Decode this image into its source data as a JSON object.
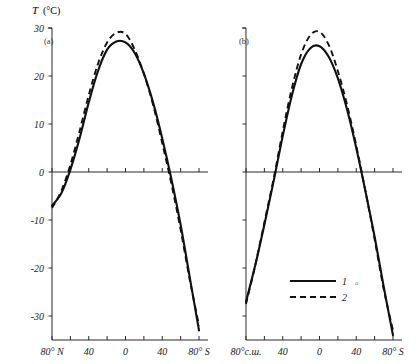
{
  "figure": {
    "y_axis_title_symbol": "T",
    "y_axis_title_unit": "(°C)",
    "panel_a_label": "(a)",
    "panel_b_label": "(b)"
  },
  "legend": {
    "entry1_label": "1",
    "entry2_label": "2",
    "stray_mark": "a"
  },
  "axis": {
    "y_ticks": [
      "30",
      "20",
      "10",
      "0",
      "-10",
      "-20",
      "-30"
    ],
    "panel_a_x_ticks": [
      "80°",
      "N",
      "40",
      "0",
      "40",
      "80",
      "S"
    ],
    "panel_b_x_ticks": [
      "80°с.ш.",
      "40",
      "0",
      "40",
      "80",
      "S"
    ]
  },
  "chart_data": {
    "type": "line",
    "title": "T (°C)",
    "xlabel": "Latitude",
    "ylabel": "T (°C)",
    "ylim": [
      -35,
      30
    ],
    "xlim": [
      80,
      -80
    ],
    "grid": false,
    "legend_position": "bottom-right",
    "panels": [
      {
        "name": "(a)",
        "x_tick_values": [
          80,
          60,
          40,
          20,
          0,
          -20,
          -40,
          -60,
          -80
        ],
        "x_tick_labels": [
          "80° N",
          "",
          "40",
          "",
          "0",
          "",
          "40",
          "",
          "80° S"
        ],
        "series": [
          {
            "name": "1",
            "style": "solid",
            "x": [
              80,
              70,
              60,
              50,
              40,
              30,
              20,
              10,
              0,
              -10,
              -20,
              -30,
              -40,
              -50,
              -60,
              -70,
              -80
            ],
            "values": [
              -7.0,
              -4.5,
              0.5,
              7.0,
              14.5,
              21.0,
              25.5,
              27.2,
              27.0,
              24.8,
              20.5,
              14.5,
              7.0,
              -1.5,
              -11.0,
              -22.0,
              -33.0
            ]
          },
          {
            "name": "2",
            "style": "dashed",
            "x": [
              80,
              70,
              60,
              50,
              40,
              30,
              20,
              10,
              0,
              -10,
              -20,
              -30,
              -40,
              -50,
              -60,
              -70,
              -80
            ],
            "values": [
              -7.5,
              -4.0,
              1.5,
              8.5,
              16.0,
              22.5,
              27.0,
              29.0,
              28.8,
              25.5,
              20.5,
              14.0,
              6.0,
              -2.5,
              -12.0,
              -22.5,
              -32.0
            ]
          }
        ]
      },
      {
        "name": "(b)",
        "x_tick_values": [
          80,
          60,
          40,
          20,
          0,
          -20,
          -40,
          -60,
          -80
        ],
        "x_tick_labels": [
          "80°с.ш.",
          "",
          "40",
          "",
          "0",
          "",
          "40",
          "",
          "80° S"
        ],
        "series": [
          {
            "name": "1",
            "style": "solid",
            "x": [
              80,
              70,
              60,
              50,
              40,
              30,
              20,
              10,
              0,
              -10,
              -20,
              -30,
              -40,
              -50,
              -60,
              -70,
              -80
            ],
            "values": [
              -27.0,
              -19.5,
              -11.0,
              -2.0,
              7.5,
              16.0,
              22.5,
              25.8,
              26.2,
              24.0,
              19.5,
              13.0,
              5.0,
              -4.0,
              -13.5,
              -24.0,
              -34.0
            ]
          },
          {
            "name": "2",
            "style": "dashed",
            "x": [
              80,
              70,
              60,
              50,
              40,
              30,
              20,
              10,
              0,
              -10,
              -20,
              -30,
              -40,
              -50,
              -60,
              -70,
              -80
            ],
            "values": [
              -27.5,
              -19.5,
              -10.5,
              -1.5,
              8.5,
              17.5,
              24.5,
              28.5,
              29.2,
              26.5,
              21.0,
              14.0,
              5.5,
              -4.0,
              -14.0,
              -24.5,
              -33.0
            ]
          }
        ]
      }
    ]
  }
}
